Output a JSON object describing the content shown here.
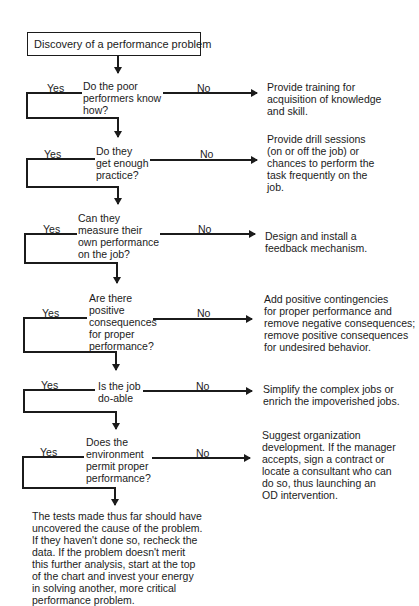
{
  "start": "Discovery of a performance problem",
  "yes_label": "Yes",
  "no_label": "No",
  "steps": [
    {
      "question": "Do the poor\nperformers know\nhow?",
      "action": "Provide training for\nacquisition of knowledge\nand skill."
    },
    {
      "question": "Do they\nget enough\npractice?",
      "action": "Provide drill sessions\n(on or off the job) or\nchances to perform the\ntask frequently on the\njob."
    },
    {
      "question": "Can they\nmeasure their\nown performance\non the job?",
      "action": "Design and install a\nfeedback mechanism."
    },
    {
      "question": "Are there\npositive\nconsequences\nfor proper\nperformance?",
      "action": "Add positive contingencies\nfor proper performance and\nremove negative consequences;\nremove positive consequences\nfor undesired behavior."
    },
    {
      "question": "Is the job\ndo-able",
      "action": "Simplify the complex jobs or\nenrich the impoverished jobs."
    },
    {
      "question": "Does the\nenvironment\npermit proper\nperformance?",
      "action": "Suggest organization\ndevelopment. If the manager\naccepts, sign a contract or\nlocate a consultant who can\ndo so, thus launching an\nOD intervention."
    }
  ],
  "conclusion": "The tests made thus far should have\nuncovered the cause of the problem.\nIf they haven't done so, recheck the\ndata. If the problem doesn't merit\nthis further analysis, start at the top\nof the chart and invest your energy\nin solving another, more critical\nperformance problem."
}
